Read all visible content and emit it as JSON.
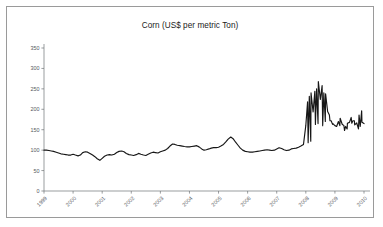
{
  "chart_data": {
    "type": "line",
    "title": "Corn (US$ per metric Ton)",
    "xlabel": "",
    "ylabel": "",
    "ylim": [
      0,
      350
    ],
    "xlim": [
      1999,
      2010
    ],
    "yticks": [
      0,
      50,
      100,
      150,
      200,
      250,
      300,
      350
    ],
    "xticks": [
      "1999",
      "2000",
      "2001",
      "2002",
      "2003",
      "2004",
      "2005",
      "2006",
      "2007",
      "2008",
      "2009",
      "2010"
    ],
    "grid": false,
    "legend": null,
    "series_color": "#171717",
    "series": [
      {
        "name": "Corn price",
        "x": [
          1999.0,
          1999.08,
          1999.17,
          1999.25,
          1999.33,
          1999.42,
          1999.5,
          1999.58,
          1999.67,
          1999.75,
          1999.83,
          1999.92,
          2000.0,
          2000.08,
          2000.17,
          2000.25,
          2000.33,
          2000.42,
          2000.5,
          2000.58,
          2000.67,
          2000.75,
          2000.83,
          2000.92,
          2001.0,
          2001.08,
          2001.17,
          2001.25,
          2001.33,
          2001.42,
          2001.5,
          2001.58,
          2001.67,
          2001.75,
          2001.83,
          2001.92,
          2002.0,
          2002.08,
          2002.17,
          2002.25,
          2002.33,
          2002.42,
          2002.5,
          2002.58,
          2002.67,
          2002.75,
          2002.83,
          2002.92,
          2003.0,
          2003.08,
          2003.17,
          2003.25,
          2003.33,
          2003.42,
          2003.5,
          2003.58,
          2003.67,
          2003.75,
          2003.83,
          2003.92,
          2004.0,
          2004.08,
          2004.17,
          2004.25,
          2004.33,
          2004.42,
          2004.5,
          2004.58,
          2004.67,
          2004.75,
          2004.83,
          2004.92,
          2005.0,
          2005.08,
          2005.17,
          2005.25,
          2005.33,
          2005.42,
          2005.5,
          2005.58,
          2005.67,
          2005.75,
          2005.83,
          2005.92,
          2006.0,
          2006.08,
          2006.17,
          2006.25,
          2006.33,
          2006.42,
          2006.5,
          2006.58,
          2006.67,
          2006.75,
          2006.83,
          2006.92,
          2007.0,
          2007.08,
          2007.17,
          2007.25,
          2007.33,
          2007.42,
          2007.5,
          2007.58,
          2007.67,
          2007.75,
          2007.83,
          2007.92,
          2008.0,
          2008.08,
          2008.17,
          2008.25,
          2008.33,
          2008.42,
          2008.5,
          2008.58,
          2008.67,
          2008.75,
          2008.83,
          2008.92,
          2009.0,
          2009.08,
          2009.17,
          2009.25,
          2009.33,
          2009.42,
          2009.5,
          2009.58,
          2009.67,
          2009.75,
          2009.83,
          2009.92
        ],
        "values": [
          100,
          100,
          99,
          98,
          97,
          95,
          93,
          91,
          90,
          89,
          88,
          88,
          90,
          88,
          86,
          88,
          94,
          96,
          95,
          92,
          88,
          84,
          79,
          75,
          80,
          85,
          88,
          89,
          88,
          90,
          94,
          97,
          98,
          96,
          92,
          89,
          88,
          87,
          89,
          92,
          90,
          88,
          87,
          90,
          93,
          95,
          94,
          93,
          96,
          98,
          100,
          104,
          110,
          115,
          114,
          112,
          111,
          110,
          109,
          108,
          108,
          109,
          110,
          111,
          108,
          103,
          100,
          101,
          103,
          105,
          106,
          106,
          107,
          110,
          114,
          120,
          127,
          132,
          128,
          120,
          112,
          105,
          100,
          97,
          96,
          95,
          95,
          96,
          97,
          98,
          99,
          100,
          101,
          100,
          99,
          100,
          103,
          106,
          104,
          101,
          99,
          100,
          103,
          104,
          105,
          107,
          110,
          114,
          116,
          118,
          122,
          140,
          163,
          165,
          163,
          160,
          170,
          177,
          172,
          163,
          158,
          162,
          160,
          155,
          148,
          152,
          160,
          166,
          172,
          178,
          186,
          196
        ]
      }
    ],
    "series_tail": {
      "x": [
        2008.0,
        2008.06,
        2008.12,
        2008.18,
        2008.25,
        2008.31,
        2008.37,
        2008.43,
        2008.5,
        2008.56,
        2008.62,
        2008.68,
        2008.75,
        2008.81,
        2008.87,
        2008.93,
        2009.0,
        2009.06,
        2009.12,
        2009.18,
        2009.25,
        2009.31,
        2009.37,
        2009.43,
        2009.5,
        2009.56,
        2009.62,
        2009.68,
        2009.75,
        2009.81,
        2009.87,
        2009.93,
        2010.0
      ],
      "values": [
        205,
        218,
        232,
        240,
        247,
        244,
        250,
        268,
        285,
        258,
        240,
        238,
        212,
        186,
        172,
        165,
        162,
        158,
        170,
        178,
        172,
        160,
        158,
        166,
        176,
        180,
        172,
        162,
        155,
        152,
        158,
        168,
        165
      ]
    }
  },
  "axis": {
    "y_tick_labels": [
      "350",
      "300",
      "250",
      "200",
      "150",
      "100",
      "50",
      "0"
    ],
    "x_tick_labels": [
      "1999",
      "2000",
      "2001",
      "2002",
      "2003",
      "2004",
      "2005",
      "2006",
      "2007",
      "2008",
      "2009",
      "2010"
    ]
  }
}
